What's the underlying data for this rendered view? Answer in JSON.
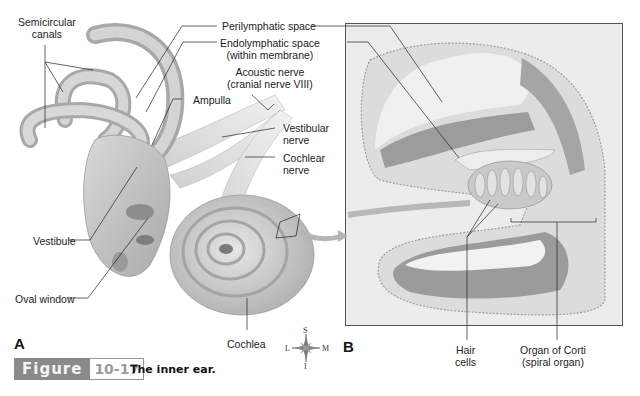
{
  "figure": {
    "badge_word": "Figure",
    "badge_number": "10-17",
    "caption": "The inner ear.",
    "colors": {
      "badge_bg": "#8a8a8a",
      "badge_num": "#9a9a9a",
      "tissue": "#bdbdbd",
      "background": "#ffffff"
    }
  },
  "panel_a": {
    "letter": "A",
    "labels": {
      "semicircular_canals": [
        "Semicircular",
        "canals"
      ],
      "perilymphatic_space": "Perilymphatic space",
      "endolymphatic_space": [
        "Endolymphatic space",
        "(within membrane)"
      ],
      "acoustic_nerve": [
        "Acoustic nerve",
        "(cranial nerve VIII)"
      ],
      "ampulla": "Ampulla",
      "vestibular_nerve": [
        "Vestibular",
        "nerve"
      ],
      "cochlear_nerve": [
        "Cochlear",
        "nerve"
      ],
      "vestibule": "Vestibule",
      "oval_window": "Oval window",
      "cochlea": "Cochlea"
    }
  },
  "compass": {
    "top": "S",
    "bottom": "I",
    "left": "L",
    "right": "M"
  },
  "panel_b": {
    "letter": "B",
    "labels": {
      "hair_cells": [
        "Hair",
        "cells"
      ],
      "organ_of_corti": [
        "Organ of Corti",
        "(spiral organ)"
      ]
    }
  }
}
